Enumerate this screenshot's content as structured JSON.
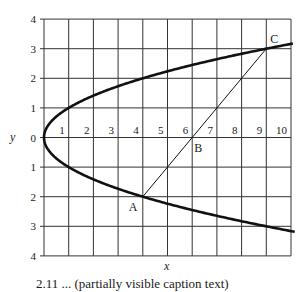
{
  "diagram": {
    "x_axis_label": "x",
    "y_axis_label": "y",
    "x_tick_labels": [
      "1",
      "2",
      "3",
      "4",
      "5",
      "6",
      "7",
      "8",
      "9",
      "10"
    ],
    "y_tick_labels_upper": [
      "4",
      "3",
      "2",
      "1",
      "0"
    ],
    "y_tick_labels_lower": [
      "1",
      "2",
      "3",
      "4"
    ],
    "curve": "x = y^2",
    "points": [
      {
        "label": "A",
        "x": 4,
        "y": -2
      },
      {
        "label": "B",
        "x": 6,
        "y": 0
      },
      {
        "label": "C",
        "x": 9,
        "y": 3
      }
    ],
    "colors": {
      "ink": "#1a1a1a",
      "grid": "#333333",
      "background": "#ffffff"
    }
  },
  "caption": "2.11 ... (partially visible caption text)"
}
